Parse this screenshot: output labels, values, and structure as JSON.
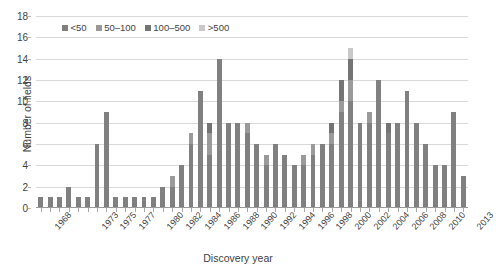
{
  "chart_data": {
    "type": "bar",
    "stacked": true,
    "title": "",
    "xlabel": "Discovery year",
    "ylabel": "Number of fields",
    "ylim": [
      0,
      18
    ],
    "ytick_step": 2,
    "yticks": [
      0,
      2,
      4,
      6,
      8,
      10,
      12,
      14,
      16,
      18
    ],
    "grid": true,
    "legend_position": "top-left-inside",
    "legend": [
      "<50",
      "50–100",
      "100–500",
      ">500"
    ],
    "colors": {
      "lt50": "#808080",
      "50_100": "#9a9a9a",
      "100_500": "#747474",
      "gt500": "#c9c9c9"
    },
    "categories": [
      "1968",
      "1969",
      "1970",
      "1971",
      "1972",
      "1973",
      "1974",
      "1975",
      "1976",
      "1977",
      "1978",
      "1979",
      "1980",
      "1981",
      "1982",
      "1983",
      "1984",
      "1985",
      "1986",
      "1987",
      "1988",
      "1989",
      "1990",
      "1991",
      "1992",
      "1993",
      "1994",
      "1995",
      "1996",
      "1997",
      "1998",
      "1999",
      "2000",
      "2001",
      "2002",
      "2003",
      "2004",
      "2005",
      "2006",
      "2007",
      "2008",
      "2009",
      "2010",
      "2011",
      "2012",
      "2013"
    ],
    "tick_labels": [
      "1968",
      "",
      "",
      "",
      "",
      "1973",
      "",
      "1975",
      "",
      "1977",
      "",
      "",
      "1980",
      "",
      "1982",
      "",
      "1984",
      "",
      "1986",
      "",
      "1988",
      "",
      "1990",
      "",
      "1992",
      "",
      "1994",
      "",
      "1996",
      "",
      "1998",
      "",
      "2000",
      "",
      "2002",
      "",
      "2004",
      "",
      "2006",
      "",
      "2008",
      "",
      "2010",
      "",
      "",
      "2013"
    ],
    "series": [
      {
        "name": "<50",
        "values": [
          1,
          1,
          1,
          2,
          1,
          1,
          6,
          9,
          1,
          1,
          1,
          1,
          1,
          2,
          2,
          4,
          6,
          11,
          5,
          14,
          8,
          8,
          7,
          6,
          4,
          6,
          5,
          4,
          4,
          5,
          6,
          6,
          9,
          10,
          8,
          8,
          12,
          7,
          8,
          11,
          8,
          6,
          4,
          4,
          9,
          3
        ]
      },
      {
        "name": "50–100",
        "values": [
          0,
          0,
          0,
          0,
          0,
          0,
          0,
          0,
          0,
          0,
          0,
          0,
          0,
          0,
          1,
          0,
          1,
          0,
          2,
          0,
          0,
          0,
          1,
          0,
          1,
          0,
          0,
          0,
          1,
          1,
          0,
          1,
          1,
          2,
          0,
          1,
          0,
          0,
          0,
          0,
          0,
          0,
          0,
          0,
          0,
          0
        ]
      },
      {
        "name": "100–500",
        "values": [
          0,
          0,
          0,
          0,
          0,
          0,
          0,
          0,
          0,
          0,
          0,
          0,
          0,
          0,
          0,
          0,
          0,
          0,
          1,
          0,
          0,
          0,
          0,
          0,
          0,
          0,
          0,
          0,
          0,
          0,
          0,
          1,
          2,
          2,
          0,
          0,
          0,
          1,
          0,
          0,
          0,
          0,
          0,
          0,
          0,
          0
        ]
      },
      {
        "name": ">500",
        "values": [
          0,
          0,
          0,
          0,
          0,
          0,
          0,
          0,
          0,
          0,
          0,
          0,
          0,
          0,
          0,
          0,
          0,
          0,
          0,
          0,
          0,
          0,
          0,
          0,
          0,
          0,
          0,
          0,
          0,
          0,
          0,
          0,
          0,
          1,
          0,
          0,
          0,
          0,
          0,
          0,
          0,
          0,
          0,
          0,
          0,
          0
        ]
      }
    ],
    "totals": [
      1,
      1,
      1,
      2,
      1,
      1,
      6,
      9,
      1,
      1,
      1,
      1,
      1,
      2,
      3,
      4,
      7,
      11,
      8,
      14,
      8,
      8,
      8,
      6,
      5,
      6,
      5,
      4,
      5,
      6,
      6,
      8,
      12,
      15,
      8,
      9,
      12,
      8,
      8,
      11,
      8,
      6,
      4,
      4,
      9,
      3
    ]
  }
}
